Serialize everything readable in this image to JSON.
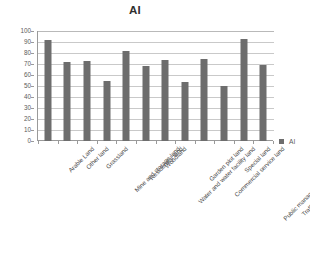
{
  "chart_data": {
    "type": "bar",
    "title": "AI",
    "xlabel": "",
    "ylabel": "",
    "ylim": [
      0,
      100
    ],
    "ytick_step": 10,
    "yticks": [
      100,
      90,
      80,
      70,
      60,
      50,
      40,
      30,
      20,
      10,
      0
    ],
    "grid": true,
    "legend_position": "right",
    "series_name": "AI",
    "series_color": "#6d6d6d",
    "categories": [
      "Arable Land",
      "Other land",
      "Grassland",
      "Mine and storage land",
      "Residential land",
      "Woodland",
      "Water and water facility land",
      "Garden plot land",
      "Commercial service land",
      "Special land",
      "Public management and service land",
      "Traffic and Transmission Land Use"
    ],
    "values": [
      92,
      72,
      73,
      55,
      82,
      68,
      74,
      54,
      75,
      50,
      93,
      69
    ],
    "series": [
      {
        "name": "AI",
        "values": [
          92,
          72,
          73,
          55,
          82,
          68,
          74,
          54,
          75,
          50,
          93,
          69
        ]
      }
    ]
  },
  "legend": {
    "entries": [
      {
        "label": "AI",
        "color": "#6d6d6d",
        "marker": "square-marker"
      }
    ]
  },
  "colors": {
    "bar": "#6d6d6d",
    "gridline": "#c9c9c9",
    "axis": "#9a9a9a",
    "text": "#4a4a4a",
    "background": "#ffffff"
  }
}
